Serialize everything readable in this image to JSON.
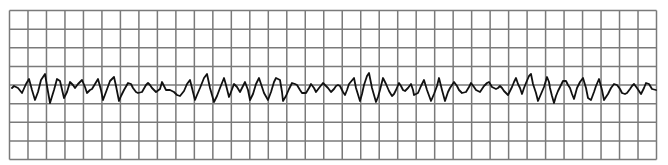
{
  "chart_data": {
    "type": "line",
    "title": "",
    "xlabel": "",
    "ylabel": "",
    "grid": {
      "on": true,
      "columns": 35,
      "rows": 8,
      "left": 9.5,
      "top": 10.5,
      "right": 656.5,
      "bottom": 159.5,
      "line_color": "#7a7a7a",
      "line_width": 1.5,
      "baseline_row": 4
    },
    "trace_color": "#111111",
    "trace_width": 1.8,
    "series": [
      {
        "name": "ECG trace",
        "points": [
          [
            12,
            88
          ],
          [
            14,
            86
          ],
          [
            18,
            88
          ],
          [
            22,
            93
          ],
          [
            26,
            84
          ],
          [
            29,
            79
          ],
          [
            32,
            90
          ],
          [
            35,
            100
          ],
          [
            38,
            92
          ],
          [
            41,
            80
          ],
          [
            45,
            74
          ],
          [
            47,
            86
          ],
          [
            50,
            103
          ],
          [
            54,
            90
          ],
          [
            57,
            79
          ],
          [
            60,
            81
          ],
          [
            64,
            98
          ],
          [
            67,
            92
          ],
          [
            70,
            82
          ],
          [
            73,
            85
          ],
          [
            75,
            88
          ],
          [
            78,
            84
          ],
          [
            82,
            80
          ],
          [
            85,
            87
          ],
          [
            87,
            93
          ],
          [
            90,
            90
          ],
          [
            92,
            89
          ],
          [
            95,
            84
          ],
          [
            98,
            79
          ],
          [
            101,
            90
          ],
          [
            103,
            100
          ],
          [
            106,
            92
          ],
          [
            110,
            81
          ],
          [
            114,
            77
          ],
          [
            116,
            86
          ],
          [
            119,
            101
          ],
          [
            121,
            96
          ],
          [
            124,
            90
          ],
          [
            128,
            83
          ],
          [
            131,
            84
          ],
          [
            133,
            88
          ],
          [
            136,
            92
          ],
          [
            138,
            93
          ],
          [
            142,
            92
          ],
          [
            146,
            85
          ],
          [
            148,
            83
          ],
          [
            150,
            85
          ],
          [
            152,
            88
          ],
          [
            156,
            92
          ],
          [
            160,
            89
          ],
          [
            162,
            82
          ],
          [
            164,
            86
          ],
          [
            166,
            90
          ],
          [
            170,
            90
          ],
          [
            174,
            92
          ],
          [
            177,
            95
          ],
          [
            180,
            96
          ],
          [
            184,
            91
          ],
          [
            187,
            84
          ],
          [
            190,
            80
          ],
          [
            192,
            88
          ],
          [
            195,
            100
          ],
          [
            197,
            95
          ],
          [
            200,
            88
          ],
          [
            204,
            78
          ],
          [
            207,
            74
          ],
          [
            210,
            88
          ],
          [
            214,
            102
          ],
          [
            217,
            96
          ],
          [
            220,
            88
          ],
          [
            224,
            78
          ],
          [
            226,
            85
          ],
          [
            229,
            97
          ],
          [
            231,
            92
          ],
          [
            234,
            84
          ],
          [
            237,
            87
          ],
          [
            240,
            92
          ],
          [
            243,
            86
          ],
          [
            245,
            82
          ],
          [
            248,
            90
          ],
          [
            250,
            100
          ],
          [
            253,
            94
          ],
          [
            256,
            84
          ],
          [
            259,
            78
          ],
          [
            261,
            84
          ],
          [
            264,
            93
          ],
          [
            268,
            100
          ],
          [
            271,
            92
          ],
          [
            274,
            82
          ],
          [
            276,
            78
          ],
          [
            280,
            80
          ],
          [
            282,
            92
          ],
          [
            283,
            101
          ],
          [
            286,
            96
          ],
          [
            289,
            89
          ],
          [
            292,
            83
          ],
          [
            295,
            84
          ],
          [
            297,
            85
          ],
          [
            300,
            90
          ],
          [
            302,
            93
          ],
          [
            306,
            93
          ],
          [
            309,
            88
          ],
          [
            311,
            84
          ],
          [
            314,
            88
          ],
          [
            316,
            92
          ],
          [
            319,
            88
          ],
          [
            323,
            83
          ],
          [
            326,
            86
          ],
          [
            328,
            88
          ],
          [
            331,
            92
          ],
          [
            334,
            89
          ],
          [
            336,
            86
          ],
          [
            338,
            85
          ],
          [
            340,
            86
          ],
          [
            343,
            92
          ],
          [
            345,
            95
          ],
          [
            347,
            90
          ],
          [
            349,
            84
          ],
          [
            354,
            78
          ],
          [
            356,
            88
          ],
          [
            360,
            101
          ],
          [
            362,
            94
          ],
          [
            364,
            85
          ],
          [
            367,
            76
          ],
          [
            369,
            73
          ],
          [
            372,
            88
          ],
          [
            376,
            102
          ],
          [
            378,
            97
          ],
          [
            380,
            90
          ],
          [
            383,
            78
          ],
          [
            386,
            84
          ],
          [
            389,
            91
          ],
          [
            392,
            96
          ],
          [
            394,
            94
          ],
          [
            396,
            90
          ],
          [
            399,
            83
          ],
          [
            401,
            86
          ],
          [
            403,
            90
          ],
          [
            405,
            91
          ],
          [
            408,
            88
          ],
          [
            411,
            84
          ],
          [
            413,
            90
          ],
          [
            414,
            95
          ],
          [
            418,
            93
          ],
          [
            421,
            86
          ],
          [
            424,
            80
          ],
          [
            427,
            90
          ],
          [
            431,
            101
          ],
          [
            434,
            94
          ],
          [
            437,
            86
          ],
          [
            439,
            78
          ],
          [
            442,
            90
          ],
          [
            445,
            101
          ],
          [
            448,
            92
          ],
          [
            450,
            88
          ],
          [
            454,
            82
          ],
          [
            457,
            86
          ],
          [
            459,
            90
          ],
          [
            462,
            93
          ],
          [
            466,
            92
          ],
          [
            469,
            87
          ],
          [
            471,
            83
          ],
          [
            474,
            87
          ],
          [
            476,
            90
          ],
          [
            480,
            92
          ],
          [
            482,
            89
          ],
          [
            484,
            86
          ],
          [
            487,
            83
          ],
          [
            489,
            82
          ],
          [
            492,
            87
          ],
          [
            494,
            88
          ],
          [
            496,
            89
          ],
          [
            498,
            88
          ],
          [
            500,
            86
          ],
          [
            502,
            88
          ],
          [
            504,
            91
          ],
          [
            506,
            93
          ],
          [
            508,
            95
          ],
          [
            510,
            91
          ],
          [
            512,
            87
          ],
          [
            514,
            82
          ],
          [
            516,
            78
          ],
          [
            518,
            84
          ],
          [
            520,
            88
          ],
          [
            522,
            94
          ],
          [
            524,
            88
          ],
          [
            526,
            83
          ],
          [
            529,
            76
          ],
          [
            531,
            74
          ],
          [
            533,
            84
          ],
          [
            536,
            93
          ],
          [
            538,
            101
          ],
          [
            541,
            94
          ],
          [
            544,
            87
          ],
          [
            547,
            77
          ],
          [
            549,
            82
          ],
          [
            550,
            88
          ],
          [
            552,
            96
          ],
          [
            554,
            103
          ],
          [
            556,
            96
          ],
          [
            558,
            91
          ],
          [
            560,
            87
          ],
          [
            563,
            81
          ],
          [
            566,
            81
          ],
          [
            568,
            85
          ],
          [
            570,
            88
          ],
          [
            572,
            94
          ],
          [
            574,
            99
          ],
          [
            577,
            88
          ],
          [
            580,
            82
          ],
          [
            583,
            78
          ],
          [
            586,
            88
          ],
          [
            588,
            98
          ],
          [
            591,
            100
          ],
          [
            594,
            92
          ],
          [
            596,
            86
          ],
          [
            599,
            79
          ],
          [
            602,
            90
          ],
          [
            604,
            100
          ],
          [
            606,
            97
          ],
          [
            608,
            94
          ],
          [
            611,
            88
          ],
          [
            614,
            84
          ],
          [
            617,
            85
          ],
          [
            620,
            89
          ],
          [
            622,
            93
          ],
          [
            625,
            94
          ],
          [
            627,
            93
          ],
          [
            630,
            89
          ],
          [
            632,
            86
          ],
          [
            634,
            84
          ],
          [
            637,
            88
          ],
          [
            639,
            91
          ],
          [
            641,
            94
          ],
          [
            644,
            88
          ],
          [
            646,
            83
          ],
          [
            649,
            84
          ],
          [
            652,
            89
          ],
          [
            656,
            90
          ]
        ]
      }
    ],
    "xlim": [
      9.5,
      656.5
    ],
    "ylim": [
      10.5,
      159.5
    ],
    "legend": null
  }
}
